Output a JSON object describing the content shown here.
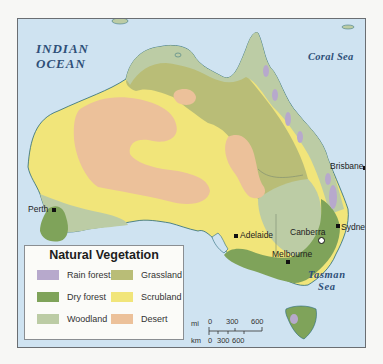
{
  "map": {
    "title": "Natural Vegetation of Australia",
    "water_labels": {
      "indian_ocean_line1": "INDIAN",
      "indian_ocean_line2": "OCEAN",
      "coral_sea": "Coral Sea",
      "tasman_line1": "Tasman",
      "tasman_line2": "Sea"
    },
    "cities": [
      {
        "name": "Perth",
        "type": "city"
      },
      {
        "name": "Adelaide",
        "type": "city"
      },
      {
        "name": "Melbourne",
        "type": "city"
      },
      {
        "name": "Canberra",
        "type": "capital"
      },
      {
        "name": "Sydney",
        "type": "city"
      },
      {
        "name": "Brisbane",
        "type": "city"
      }
    ],
    "colors": {
      "ocean": "#cfe3f1",
      "rain_forest": "#b7a9cc",
      "dry_forest": "#7fa35a",
      "woodland": "#bccca5",
      "grassland": "#b9bd77",
      "scrubland": "#f1e57a",
      "desert": "#ecc19a",
      "coast": "#2a6a7a"
    }
  },
  "legend": {
    "title": "Natural Vegetation",
    "items": [
      {
        "label": "Rain forest",
        "color": "#b7a9cc"
      },
      {
        "label": "Dry forest",
        "color": "#7fa35a"
      },
      {
        "label": "Woodland",
        "color": "#bccca5"
      },
      {
        "label": "Grassland",
        "color": "#b9bd77"
      },
      {
        "label": "Scrubland",
        "color": "#f1e57a"
      },
      {
        "label": "Desert",
        "color": "#ecc19a"
      }
    ]
  },
  "scale_bar": {
    "mi_label": "mi",
    "km_label": "km",
    "mi_ticks": [
      "0",
      "300",
      "600"
    ],
    "km_ticks": [
      "0",
      "300",
      "600"
    ]
  }
}
